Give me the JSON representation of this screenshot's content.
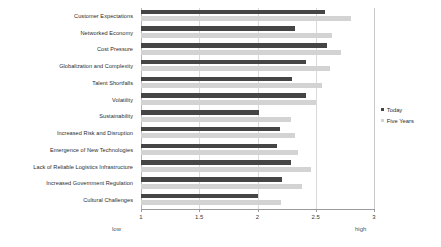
{
  "chart_data": {
    "type": "bar",
    "orientation": "horizontal",
    "title": "",
    "xlabel": "",
    "ylabel": "",
    "xlim": [
      1,
      3
    ],
    "xticks": [
      "1",
      "1.5",
      "2",
      "2.5",
      "3"
    ],
    "xtick_values": [
      1,
      1.5,
      2,
      2.5,
      3
    ],
    "grid": true,
    "axis_endcap_low": "low",
    "axis_endcap_high": "high",
    "legend_position": "right",
    "categories": [
      "Customer Expectations",
      "Networked Economy",
      "Cost Pressure",
      "Globalization and Complexity",
      "Talent Shortfalls",
      "Volatility",
      "Sustainability",
      "Increased Risk and Disruption",
      "Emergence of New Technologies",
      "Lack of Reliable Logistics Infrastructure",
      "Increased Government Regulation",
      "Cultural Challenges"
    ],
    "series": [
      {
        "name": "Today",
        "color": "#454545",
        "values": [
          2.58,
          2.32,
          2.6,
          2.42,
          2.3,
          2.42,
          2.01,
          2.19,
          2.17,
          2.29,
          2.21,
          2.0
        ]
      },
      {
        "name": "Five Years",
        "color": "#d3d3d3",
        "values": [
          2.8,
          2.64,
          2.72,
          2.62,
          2.55,
          2.5,
          2.29,
          2.32,
          2.35,
          2.46,
          2.38,
          2.2
        ]
      }
    ]
  },
  "legend": {
    "items": [
      {
        "label": "Today",
        "color": "#454545"
      },
      {
        "label": "Five Years",
        "color": "#d3d3d3"
      }
    ]
  }
}
